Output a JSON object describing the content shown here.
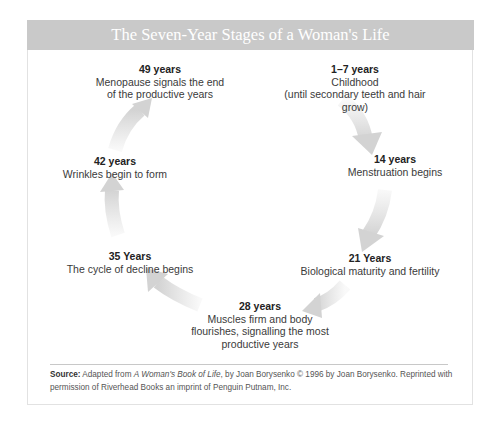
{
  "title": "The Seven-Year Stages of a Woman's Life",
  "stages": [
    {
      "age": "1–7 years",
      "desc": [
        "Childhood",
        "(until secondary teeth and hair grow)"
      ]
    },
    {
      "age": "14 years",
      "desc": [
        "Menstruation begins"
      ]
    },
    {
      "age": "21 Years",
      "desc": [
        "Biological maturity and fertility"
      ]
    },
    {
      "age": "28 years",
      "desc": [
        "Muscles firm and body",
        "flourishes, signalling the most",
        "productive years"
      ]
    },
    {
      "age": "35 Years",
      "desc": [
        "The cycle of decline begins"
      ]
    },
    {
      "age": "42 years",
      "desc": [
        "Wrinkles begin to form"
      ]
    },
    {
      "age": "49 years",
      "desc": [
        "Menopause signals the end",
        "of the productive years"
      ]
    }
  ],
  "source": {
    "label": "Source:",
    "text_before": " Adapted from ",
    "book": "A Woman's Book of Life",
    "text_after": ", by Joan Borysenko © 1996 by Joan Borysenko. Reprinted with permission of Riverhead Books an imprint of Penguin Putnam, Inc."
  },
  "colors": {
    "header_bg": "#c9c9c9",
    "arrow": "#d6d6d6",
    "text": "#333333"
  }
}
